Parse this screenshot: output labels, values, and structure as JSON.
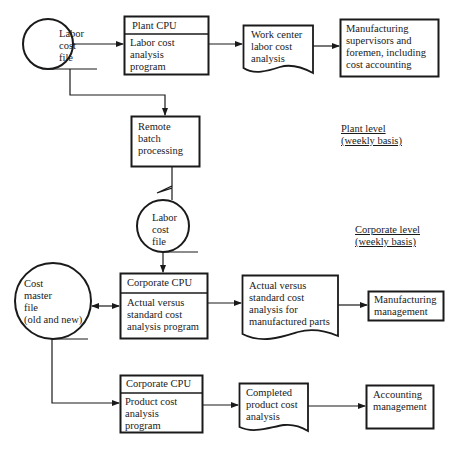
{
  "diagram": {
    "type": "system-flowchart",
    "nodes": {
      "labor_cost_file_plant": {
        "shape": "storage-circle",
        "lines": [
          "Labor",
          "cost",
          "file"
        ]
      },
      "plant_cpu": {
        "shape": "process-box",
        "header": "Plant CPU",
        "lines": [
          "Labor cost",
          "analysis",
          "program"
        ]
      },
      "work_center_report": {
        "shape": "document",
        "lines": [
          "Work center",
          "labor cost",
          "analysis"
        ]
      },
      "mfg_supervisors": {
        "shape": "box",
        "lines": [
          "Manufacturing",
          "supervisors and",
          "foremen, including",
          "cost accounting"
        ]
      },
      "remote_batch": {
        "shape": "box",
        "lines": [
          "Remote",
          "batch",
          "processing"
        ]
      },
      "labor_cost_file_corp": {
        "shape": "storage-circle",
        "lines": [
          "Labor",
          "cost",
          "file"
        ]
      },
      "corporate_cpu_1": {
        "shape": "process-box",
        "header": "Corporate CPU",
        "lines": [
          "Actual versus",
          "standard cost",
          "analysis program"
        ]
      },
      "cost_master_file": {
        "shape": "storage-circle",
        "lines": [
          "Cost",
          "master",
          "file",
          "(old and new)"
        ]
      },
      "actual_vs_standard_report": {
        "shape": "document",
        "lines": [
          "Actual versus",
          "standard cost",
          "analysis for",
          "manufactured parts"
        ]
      },
      "mfg_management": {
        "shape": "box",
        "lines": [
          "Manufacturing",
          "management"
        ]
      },
      "corporate_cpu_2": {
        "shape": "process-box",
        "header": "Corporate CPU",
        "lines": [
          "Product cost",
          "analysis",
          "program"
        ]
      },
      "completed_product_report": {
        "shape": "document",
        "lines": [
          "Completed",
          "product cost",
          "analysis"
        ]
      },
      "accounting_management": {
        "shape": "box",
        "lines": [
          "Accounting",
          "management"
        ]
      }
    },
    "edges": [
      {
        "from": "labor_cost_file_plant",
        "to": "plant_cpu"
      },
      {
        "from": "plant_cpu",
        "to": "work_center_report"
      },
      {
        "from": "work_center_report",
        "to": "mfg_supervisors"
      },
      {
        "from": "labor_cost_file_plant",
        "to": "remote_batch"
      },
      {
        "from": "remote_batch",
        "to": "labor_cost_file_corp",
        "style": "communication-link"
      },
      {
        "from": "labor_cost_file_corp",
        "to": "corporate_cpu_1"
      },
      {
        "from": "cost_master_file",
        "to": "corporate_cpu_1",
        "bidirectional": true
      },
      {
        "from": "corporate_cpu_1",
        "to": "actual_vs_standard_report"
      },
      {
        "from": "actual_vs_standard_report",
        "to": "mfg_management"
      },
      {
        "from": "cost_master_file",
        "to": "corporate_cpu_2"
      },
      {
        "from": "corporate_cpu_2",
        "to": "completed_product_report"
      },
      {
        "from": "completed_product_report",
        "to": "accounting_management"
      }
    ],
    "annotations": {
      "plant_level": {
        "line1": "Plant level",
        "line2": "(weekly basis)"
      },
      "corporate_level": {
        "line1": "Corporate level",
        "line2": "(weekly basis)"
      }
    }
  },
  "colors": {
    "ink": "#1a1a1a",
    "background": "#ffffff"
  }
}
